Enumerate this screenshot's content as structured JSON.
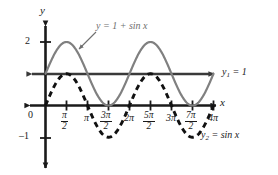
{
  "figure": {
    "background": "#ffffff",
    "axis_color": "#1a1a1a",
    "curve1_color": "#808080",
    "curve2_color": "#111111"
  },
  "axes": {
    "x_axis_label": "x",
    "y_axis_label": "y",
    "origin_label": "0",
    "y_ticks": [
      {
        "label": "2",
        "value": 2
      },
      {
        "label": "–1",
        "value": -1
      }
    ],
    "x_ticks": [
      {
        "label": "π/2",
        "num": "π",
        "den": "2",
        "kind": "fraction",
        "value": 1.5708
      },
      {
        "label": "π",
        "kind": "plain",
        "value": 3.1416
      },
      {
        "label": "3π/2",
        "num": "3π",
        "den": "2",
        "kind": "fraction",
        "value": 4.7124
      },
      {
        "label": "2π",
        "kind": "plain",
        "value": 6.2832
      },
      {
        "label": "5π/2",
        "num": "5π",
        "den": "2",
        "kind": "fraction",
        "value": 7.854
      },
      {
        "label": "3π",
        "kind": "plain",
        "value": 9.4248
      },
      {
        "label": "7π/2",
        "num": "7π",
        "den": "2",
        "kind": "fraction",
        "value": 10.9956
      },
      {
        "label": "4π",
        "kind": "plain",
        "value": 12.5664
      }
    ]
  },
  "annotations": {
    "curve1_callout": "y = 1 + sin x",
    "line_label_name": "y",
    "line_label_sub": "1",
    "line_label_rest": "= 1",
    "curve2_label_name": "y",
    "curve2_label_sub": "2",
    "curve2_label_rest": "= sin x"
  },
  "chart_data": {
    "type": "line",
    "xlabel": "x",
    "ylabel": "y",
    "xlim": [
      -1.2,
      13.6
    ],
    "ylim": [
      -1.55,
      2.6
    ],
    "grid": false,
    "legend": "inline annotations",
    "x_tick_values": [
      0,
      1.5708,
      3.1416,
      4.7124,
      6.2832,
      7.854,
      9.4248,
      10.9956,
      12.5664
    ],
    "x_tick_labels": [
      "0",
      "π/2",
      "π",
      "3π/2",
      "2π",
      "5π/2",
      "3π",
      "7π/2",
      "4π"
    ],
    "y_tick_values": [
      2,
      -1
    ],
    "y_tick_labels": [
      "2",
      "–1"
    ],
    "series": [
      {
        "name": "y = 1 + sin x",
        "style": "solid",
        "color": "#808080",
        "formula": "1 + sin(x)",
        "domain": [
          0,
          12.5664
        ],
        "amplitude": 1,
        "vertical_shift": 1,
        "period": 6.2832,
        "maxima": [
          {
            "x": 1.5708,
            "y": 2
          },
          {
            "x": 7.854,
            "y": 2
          }
        ],
        "minima": [
          {
            "x": 4.7124,
            "y": 0
          },
          {
            "x": 10.9956,
            "y": 0
          }
        ]
      },
      {
        "name": "y₂ = sin x",
        "style": "dashed",
        "color": "#111111",
        "formula": "sin(x)",
        "domain": [
          0,
          12.5664
        ],
        "amplitude": 1,
        "vertical_shift": 0,
        "period": 6.2832,
        "maxima": [
          {
            "x": 1.5708,
            "y": 1
          },
          {
            "x": 7.854,
            "y": 1
          }
        ],
        "minima": [
          {
            "x": 4.7124,
            "y": -1
          },
          {
            "x": 10.9956,
            "y": -1
          }
        ]
      },
      {
        "name": "y₁ = 1",
        "style": "solid-arrowed",
        "color": "#3a3a3a",
        "formula": "1",
        "constant": 1
      }
    ]
  }
}
